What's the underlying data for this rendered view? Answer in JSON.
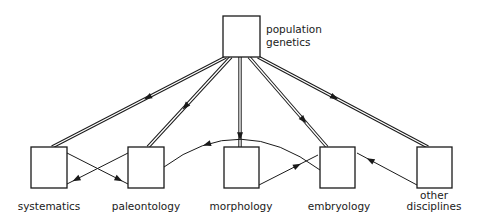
{
  "nodes": [
    {
      "id": "population-genetics",
      "label_lines": [
        "population",
        "genetics"
      ]
    },
    {
      "id": "systematics",
      "label_lines": [
        "systematics"
      ]
    },
    {
      "id": "paleontology",
      "label_lines": [
        "paleontology"
      ]
    },
    {
      "id": "morphology",
      "label_lines": [
        "morphology"
      ]
    },
    {
      "id": "embryology",
      "label_lines": [
        "embryology"
      ]
    },
    {
      "id": "other-disciplines",
      "label_lines": [
        "other",
        "disciplines"
      ]
    }
  ],
  "edges": [
    {
      "from": "population-genetics",
      "to": "systematics",
      "style": "double"
    },
    {
      "from": "population-genetics",
      "to": "paleontology",
      "style": "double"
    },
    {
      "from": "population-genetics",
      "to": "morphology",
      "style": "double"
    },
    {
      "from": "population-genetics",
      "to": "embryology",
      "style": "double"
    },
    {
      "from": "population-genetics",
      "to": "other-disciplines",
      "style": "double"
    },
    {
      "from": "systematics",
      "to": "paleontology",
      "style": "single"
    },
    {
      "from": "paleontology",
      "to": "systematics",
      "style": "single"
    },
    {
      "from": "embryology",
      "to": "paleontology",
      "style": "single-arc"
    },
    {
      "from": "morphology",
      "to": "embryology",
      "style": "single"
    },
    {
      "from": "other-disciplines",
      "to": "embryology",
      "style": "single"
    }
  ]
}
